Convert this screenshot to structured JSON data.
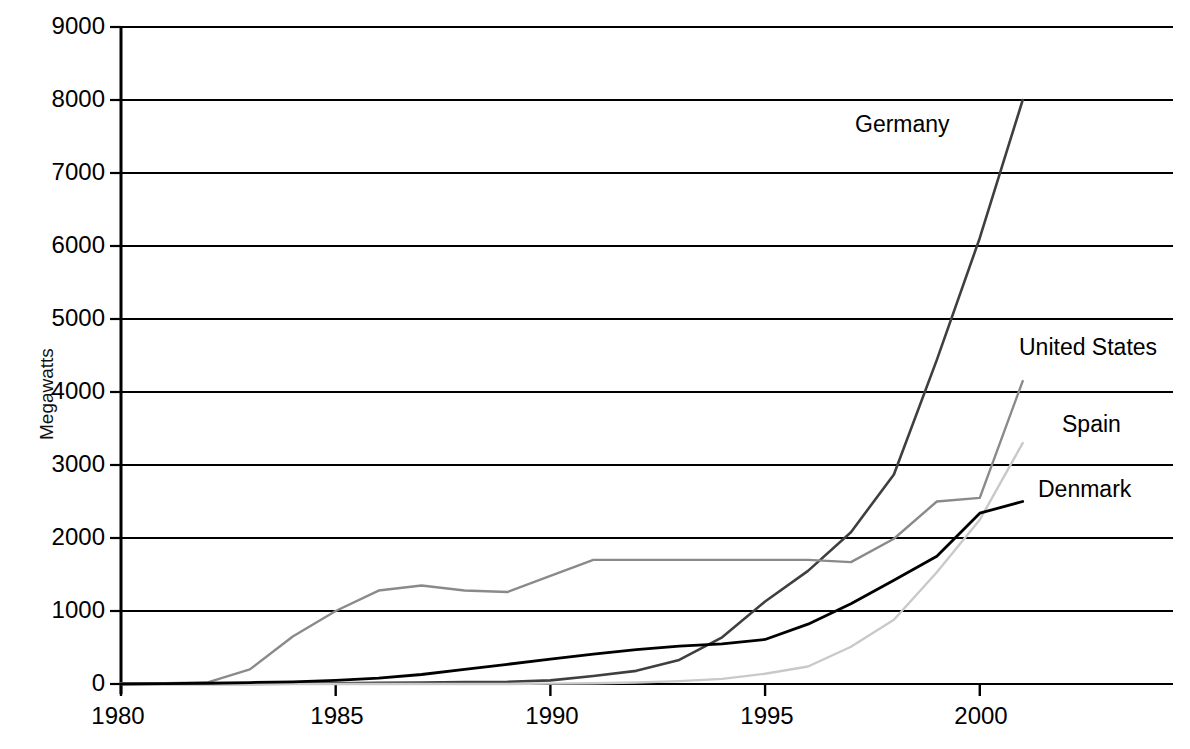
{
  "chart_data": {
    "type": "line",
    "title": "",
    "xlabel": "",
    "ylabel": "Megawatts",
    "xlim": [
      1980,
      2004.5
    ],
    "ylim": [
      0,
      9000
    ],
    "grid": true,
    "legend_position": "inline-right-end-labels",
    "x_ticks": [
      1980,
      1985,
      1990,
      1995,
      2000
    ],
    "x_tick_labels": [
      "1980",
      "1985",
      "1990",
      "1995",
      "2000"
    ],
    "y_ticks": [
      0,
      1000,
      2000,
      3000,
      4000,
      5000,
      6000,
      7000,
      8000,
      9000
    ],
    "y_tick_labels": [
      "0",
      "1000",
      "2000",
      "3000",
      "4000",
      "5000",
      "6000",
      "7000",
      "8000",
      "9000"
    ],
    "series": [
      {
        "name": "Germany",
        "label": "Germany",
        "color": "#3f3f3f",
        "width": 2.6,
        "x": [
          1980,
          1981,
          1982,
          1983,
          1984,
          1985,
          1986,
          1987,
          1988,
          1989,
          1990,
          1991,
          1992,
          1993,
          1994,
          1995,
          1996,
          1997,
          1998,
          1999,
          2000,
          2001
        ],
        "values": [
          0,
          0,
          0,
          0,
          5,
          10,
          15,
          20,
          25,
          30,
          50,
          110,
          180,
          330,
          640,
          1130,
          1550,
          2080,
          2870,
          4440,
          6110,
          8000
        ]
      },
      {
        "name": "United States",
        "label": "United States",
        "color": "#8a8a8a",
        "width": 2.4,
        "x": [
          1980,
          1981,
          1982,
          1983,
          1984,
          1985,
          1986,
          1987,
          1988,
          1989,
          1990,
          1991,
          1992,
          1993,
          1994,
          1995,
          1996,
          1997,
          1998,
          1999,
          2000,
          2001
        ],
        "values": [
          10,
          10,
          20,
          200,
          650,
          1000,
          1280,
          1350,
          1280,
          1260,
          1480,
          1700,
          1700,
          1700,
          1700,
          1700,
          1700,
          1670,
          1990,
          2500,
          2550,
          4150
        ]
      },
      {
        "name": "Spain",
        "label": "Spain",
        "color": "#c9c9c9",
        "width": 2.4,
        "x": [
          1980,
          1981,
          1982,
          1983,
          1984,
          1985,
          1986,
          1987,
          1988,
          1989,
          1990,
          1991,
          1992,
          1993,
          1994,
          1995,
          1996,
          1997,
          1998,
          1999,
          2000,
          2001
        ],
        "values": [
          0,
          0,
          0,
          0,
          0,
          0,
          0,
          0,
          0,
          0,
          5,
          10,
          20,
          40,
          70,
          140,
          240,
          510,
          880,
          1530,
          2250,
          3300
        ]
      },
      {
        "name": "Denmark",
        "label": "Denmark",
        "color": "#000000",
        "width": 2.8,
        "x": [
          1980,
          1981,
          1982,
          1983,
          1984,
          1985,
          1986,
          1987,
          1988,
          1989,
          1990,
          1991,
          1992,
          1993,
          1994,
          1995,
          1996,
          1997,
          1998,
          1999,
          2000,
          2001
        ],
        "values": [
          0,
          5,
          10,
          20,
          30,
          50,
          80,
          130,
          200,
          270,
          340,
          410,
          470,
          520,
          550,
          610,
          820,
          1100,
          1420,
          1750,
          2340,
          2500
        ]
      }
    ],
    "end_labels": [
      {
        "name": "Germany",
        "text": "Germany",
        "x_px": 855,
        "y_px": 125
      },
      {
        "name": "United States",
        "text": "United States",
        "x_px": 1019,
        "y_px": 348
      },
      {
        "name": "Spain",
        "text": "Spain",
        "x_px": 1062,
        "y_px": 425
      },
      {
        "name": "Denmark",
        "text": "Denmark",
        "x_px": 1038,
        "y_px": 490
      }
    ]
  }
}
